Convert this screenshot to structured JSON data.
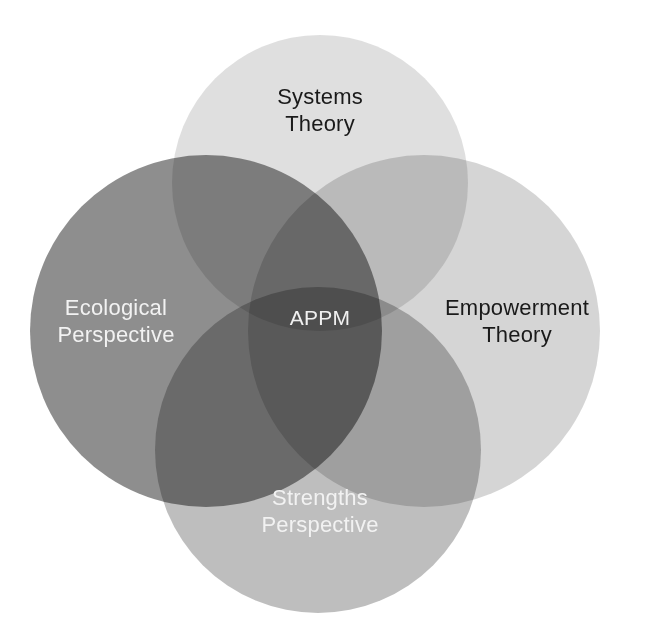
{
  "figure": {
    "type": "venn-diagram",
    "circle_count": 4,
    "background_color": "#ffffff",
    "top_rule_color": "#8b8b8b"
  },
  "chart_data": {
    "type": "venn",
    "title": "",
    "center_label": "APPM",
    "sets": [
      {
        "id": "systems-theory",
        "label": "Systems\nTheory",
        "position": "top",
        "cx": 320,
        "cy": 183,
        "r": 148,
        "fill": "#9b9b9b",
        "opacity": 0.32,
        "text_color": "#1a1a1a"
      },
      {
        "id": "ecological-perspective",
        "label": "Ecological\nPerspective",
        "position": "left",
        "cx": 206,
        "cy": 331,
        "r": 176,
        "fill": "#6e6e6e",
        "opacity": 0.78,
        "text_color": "#f2f2f2"
      },
      {
        "id": "empowerment-theory",
        "label": "Empowerment\nTheory",
        "position": "right",
        "cx": 424,
        "cy": 331,
        "r": 176,
        "fill": "#9b9b9b",
        "opacity": 0.42,
        "text_color": "#1a1a1a"
      },
      {
        "id": "strengths-perspective",
        "label": "Strengths\nPerspective",
        "position": "bottom",
        "cx": 318,
        "cy": 450,
        "r": 163,
        "fill": "#888888",
        "opacity": 0.55,
        "text_color": "#f2f2f2"
      }
    ],
    "colors": {
      "systems_only": "#e4e4e4",
      "ecological_only": "#6e6e6e",
      "empowerment_only": "#c8c8c8",
      "strengths_only": "#a0a0a0",
      "systems_empowerment_overlap": "#b4b4b4",
      "ecological_strengths_overlap": "#585858",
      "core_overlap": "#676767"
    }
  }
}
